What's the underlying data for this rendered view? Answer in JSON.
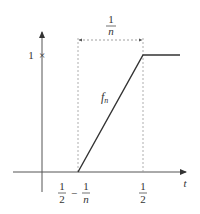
{
  "diagram": {
    "axes": {
      "x_label": "t",
      "y_tick_label": "1",
      "y_tick_mark": "×"
    },
    "function_label": {
      "base": "f",
      "subscript": "n"
    },
    "width_annotation": {
      "numerator": "1",
      "denominator": "n"
    },
    "x_ticks": {
      "left": {
        "a_num": "1",
        "a_den": "2",
        "minus": "−",
        "b_num": "1",
        "b_den": "n"
      },
      "right": {
        "num": "1",
        "den": "2"
      }
    },
    "colors": {
      "axis": "#555555",
      "curve": "#333333",
      "dashed": "#999999",
      "text": "#333333"
    }
  }
}
